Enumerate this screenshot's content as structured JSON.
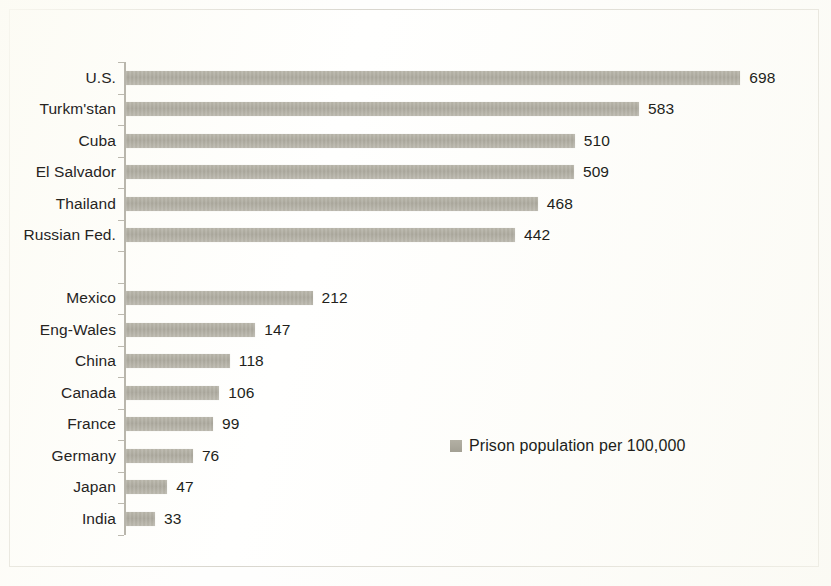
{
  "figure": {
    "background_color": "#fffffe",
    "frame_color": "#cfccc2",
    "bar_color": "#a9a69a",
    "text_color": "#221f1b"
  },
  "legend": {
    "swatch_icon": "legend-swatch-square",
    "label": "Prison population per 100,000",
    "position": "lower-right-inside"
  },
  "chart_data": {
    "type": "bar",
    "orientation": "horizontal",
    "title": "",
    "subtitle": "",
    "xlabel": "",
    "ylabel": "",
    "xlim": [
      0,
      700
    ],
    "grid": false,
    "legend_position": "lower-right",
    "series": [
      {
        "name": "Prison population per 100,000",
        "values": [
          698,
          583,
          510,
          509,
          468,
          442,
          null,
          212,
          147,
          118,
          106,
          99,
          76,
          47,
          33
        ]
      }
    ],
    "categories": [
      "U.S.",
      "Turkm'stan",
      "Cuba",
      "El Salvador",
      "Thailand",
      "Russian Fed.",
      "",
      "Mexico",
      "Eng-Wales",
      "China",
      "Canada",
      "France",
      "Germany",
      "Japan",
      "India"
    ],
    "rows": [
      {
        "label": "U.S.",
        "value": 698,
        "value_text": "698",
        "blank": false
      },
      {
        "label": "Turkm'stan",
        "value": 583,
        "value_text": "583",
        "blank": false
      },
      {
        "label": "Cuba",
        "value": 510,
        "value_text": "510",
        "blank": false
      },
      {
        "label": "El Salvador",
        "value": 509,
        "value_text": "509",
        "blank": false
      },
      {
        "label": "Thailand",
        "value": 468,
        "value_text": "468",
        "blank": false
      },
      {
        "label": "Russian Fed.",
        "value": 442,
        "value_text": "442",
        "blank": false
      },
      {
        "label": "",
        "value": null,
        "value_text": "",
        "blank": true
      },
      {
        "label": "Mexico",
        "value": 212,
        "value_text": "212",
        "blank": false
      },
      {
        "label": "Eng-Wales",
        "value": 147,
        "value_text": "147",
        "blank": false
      },
      {
        "label": "China",
        "value": 118,
        "value_text": "118",
        "blank": false
      },
      {
        "label": "Canada",
        "value": 106,
        "value_text": "106",
        "blank": false
      },
      {
        "label": "France",
        "value": 99,
        "value_text": "99",
        "blank": false
      },
      {
        "label": "Germany",
        "value": 76,
        "value_text": "76",
        "blank": false
      },
      {
        "label": "Japan",
        "value": 47,
        "value_text": "47",
        "blank": false
      },
      {
        "label": "India",
        "value": 33,
        "value_text": "33",
        "blank": false
      }
    ]
  }
}
